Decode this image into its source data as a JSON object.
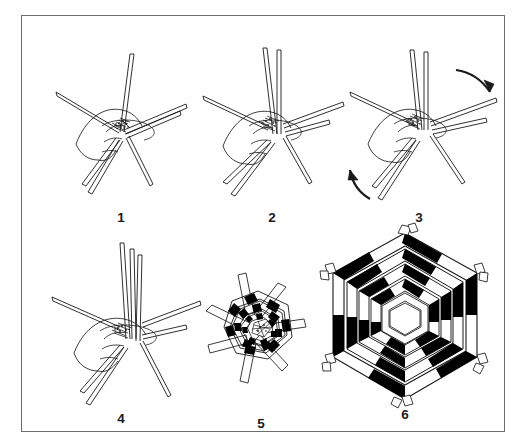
{
  "figure": {
    "border_color": "#6d6d70",
    "background_color": "#ffffff",
    "ink_color": "#1a1a1a",
    "fill_black": "#000000",
    "panel_count": 6,
    "rows": 2,
    "columns": 3
  },
  "panels": [
    {
      "id": "panel-1",
      "label": "1",
      "caption": "Hand gripping six splints crossed at centre, spokes radiating outward",
      "has_hand": true,
      "has_arrows": false,
      "spoke_count": 6,
      "stage": "start"
    },
    {
      "id": "panel-2",
      "label": "2",
      "caption": "Two splints raised vertically while hand holds the crossing point",
      "has_hand": true,
      "has_arrows": false,
      "spoke_count": 6,
      "stage": "lift"
    },
    {
      "id": "panel-3",
      "label": "3",
      "caption": "Splints rotated; curved arrows show the turning direction",
      "has_hand": true,
      "has_arrows": true,
      "spoke_count": 6,
      "stage": "rotate"
    },
    {
      "id": "panel-4",
      "label": "4",
      "caption": "Three splints standing upright, remaining spokes spread flat",
      "has_hand": true,
      "has_arrows": false,
      "spoke_count": 6,
      "stage": "arrange"
    },
    {
      "id": "panel-5",
      "label": "5",
      "caption": "Small hexagonal plait started, splint ends projecting from the rim",
      "has_hand": false,
      "has_arrows": false,
      "ring_count": 4,
      "stage": "plait-start"
    },
    {
      "id": "panel-6",
      "label": "6",
      "caption": "Finished hexagonal mat, five woven rounds with open hexagon centre",
      "has_hand": false,
      "has_arrows": false,
      "ring_count": 5,
      "stage": "finished"
    }
  ],
  "arrows": [
    {
      "id": "arrow-top-right",
      "direction": "down-right",
      "style": "curved"
    },
    {
      "id": "arrow-bottom-left",
      "direction": "up-left",
      "style": "curved"
    }
  ]
}
